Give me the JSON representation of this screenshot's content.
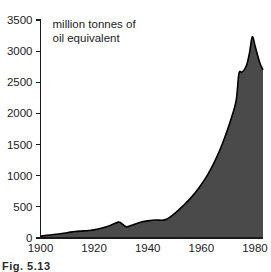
{
  "figure": {
    "caption": "Fig. 5.13",
    "background_color": "#ffffff"
  },
  "chart_data": {
    "type": "area",
    "title": "",
    "subtitle": "",
    "xlabel": "",
    "ylabel": "",
    "unit_label_line1": "million tonnes of",
    "unit_label_line2": "oil equivalent",
    "xlim": [
      1900,
      1983
    ],
    "ylim": [
      0,
      3500
    ],
    "grid": false,
    "legend": null,
    "fill_color": "#4a4a4a",
    "line_color": "#000000",
    "x_ticks": [
      1900,
      1910,
      1920,
      1930,
      1940,
      1950,
      1960,
      1970,
      1980
    ],
    "x_tick_labels": [
      "1900",
      "",
      "1920",
      "",
      "1940",
      "",
      "1960",
      "",
      "1980"
    ],
    "y_ticks": [
      0,
      500,
      1000,
      1500,
      2000,
      2500,
      3000,
      3500
    ],
    "y_tick_labels": [
      "0",
      "500",
      "1000",
      "1500",
      "2000",
      "2500",
      "3000",
      "3500"
    ],
    "x": [
      1900,
      1905,
      1910,
      1913,
      1918,
      1920,
      1923,
      1926,
      1929,
      1930,
      1932,
      1934,
      1937,
      1940,
      1943,
      1945,
      1947,
      1950,
      1953,
      1956,
      1959,
      1962,
      1965,
      1968,
      1971,
      1973,
      1974,
      1975,
      1976,
      1977,
      1978,
      1979,
      1980,
      1981,
      1982,
      1983
    ],
    "values": [
      30,
      55,
      85,
      105,
      120,
      130,
      160,
      200,
      255,
      240,
      180,
      205,
      250,
      275,
      290,
      285,
      300,
      390,
      510,
      640,
      800,
      990,
      1230,
      1530,
      1900,
      2210,
      2640,
      2660,
      2700,
      2790,
      2980,
      3230,
      3090,
      2930,
      2790,
      2700
    ]
  }
}
